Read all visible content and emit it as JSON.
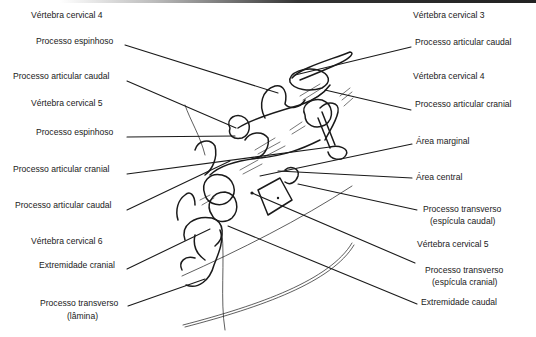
{
  "diagram": {
    "line_color": "#1a1a1a",
    "background": "#ffffff"
  },
  "labels_left": [
    {
      "id": "l1",
      "text": "Vértebra cervical 4",
      "x": 31,
      "y": 15,
      "type": "heading"
    },
    {
      "id": "l2",
      "text": "Processo espinhoso",
      "x": 36,
      "y": 41
    },
    {
      "id": "l3",
      "text": "Processo articular caudal",
      "x": 13,
      "y": 76
    },
    {
      "id": "l4",
      "text": "Vértebra cervical 5",
      "x": 31,
      "y": 103,
      "type": "heading"
    },
    {
      "id": "l5",
      "text": "Processo espinhoso",
      "x": 36,
      "y": 131
    },
    {
      "id": "l6",
      "text": "Processo articular cranial",
      "x": 13,
      "y": 168
    },
    {
      "id": "l7",
      "text": "Processo articular caudal",
      "x": 15,
      "y": 204
    },
    {
      "id": "l8",
      "text": "Vértebra cervical 6",
      "x": 31,
      "y": 240,
      "type": "heading"
    },
    {
      "id": "l9",
      "text": "Extremidade cranial",
      "x": 39,
      "y": 264
    },
    {
      "id": "l10",
      "text": "Processo transverso",
      "x": 40,
      "y": 302
    },
    {
      "id": "l10b",
      "text": "(lâmina)",
      "x": 67,
      "y": 315
    }
  ],
  "labels_right": [
    {
      "id": "r1",
      "text": "Vértebra cervical 3",
      "x": 413,
      "y": 15,
      "type": "heading"
    },
    {
      "id": "r2",
      "text": "Processo articular caudal",
      "x": 415,
      "y": 41
    },
    {
      "id": "r3",
      "text": "Vértebra cervical 4",
      "x": 413,
      "y": 76,
      "type": "heading"
    },
    {
      "id": "r4",
      "text": "Processo articular cranial",
      "x": 415,
      "y": 103
    },
    {
      "id": "r5",
      "text": "Área marginal",
      "x": 416,
      "y": 139
    },
    {
      "id": "r6",
      "text": "Área central",
      "x": 416,
      "y": 175
    },
    {
      "id": "r7",
      "text": "Processo transverso",
      "x": 423,
      "y": 207
    },
    {
      "id": "r7b",
      "text": "(espícula caudal)",
      "x": 430,
      "y": 219
    },
    {
      "id": "r8",
      "text": "Vértebra cervical 5",
      "x": 417,
      "y": 243,
      "type": "heading"
    },
    {
      "id": "r9",
      "text": "Processo transverso",
      "x": 425,
      "y": 269
    },
    {
      "id": "r9b",
      "text": "(espícula cranial)",
      "x": 432,
      "y": 281
    },
    {
      "id": "r10",
      "text": "Extremidade caudal",
      "x": 421,
      "y": 300
    }
  ]
}
